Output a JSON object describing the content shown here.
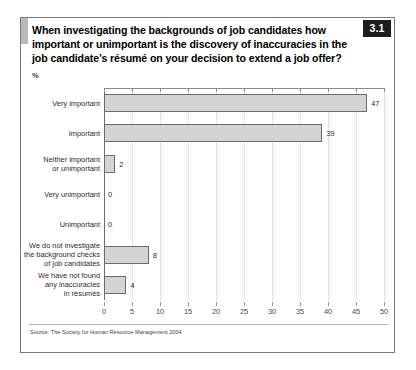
{
  "figure": {
    "number_badge": "3.1",
    "title": "When investigating the backgrounds of job candidates how important or unimportant is the discovery of inaccuracies in the job candidate’s résumé on your decision to extend a job offer?",
    "unit_label": "%",
    "source": "Source: The Society for Human Resource Management 2004"
  },
  "chart_data": {
    "type": "bar",
    "orientation": "horizontal",
    "title": "When investigating the backgrounds of job candidates how important or unimportant is the discovery of inaccuracies in the job candidate’s résumé on your decision to extend a job offer?",
    "subtitle": "",
    "xlabel": "%",
    "ylabel": "",
    "categories": [
      "Very important",
      "Important",
      "Neither important\nor unimportant",
      "Very unimportant",
      "Unimportant",
      "We do not investigate\nthe background checks\nof job candidates",
      "We have not found\nany inaccuracies\nin résumés"
    ],
    "values": [
      47,
      39,
      2,
      0,
      0,
      8,
      4
    ],
    "data_labels": [
      "47",
      "39",
      "2",
      "0",
      "0",
      "8",
      "4"
    ],
    "xlim": [
      0,
      50
    ],
    "xticks": [
      0,
      5,
      10,
      15,
      20,
      25,
      30,
      35,
      40,
      45,
      50
    ],
    "xtick_labels": [
      "0",
      "5",
      "10",
      "15",
      "20",
      "25",
      "30",
      "35",
      "40",
      "45",
      "50"
    ],
    "grid": "vertical-dotted",
    "legend": "none",
    "bar_fill": "#d4d4d4",
    "bar_edge": "#6b6b6b",
    "gridline_color": "#c6c6c6",
    "axis_color": "#6e6e6e"
  }
}
